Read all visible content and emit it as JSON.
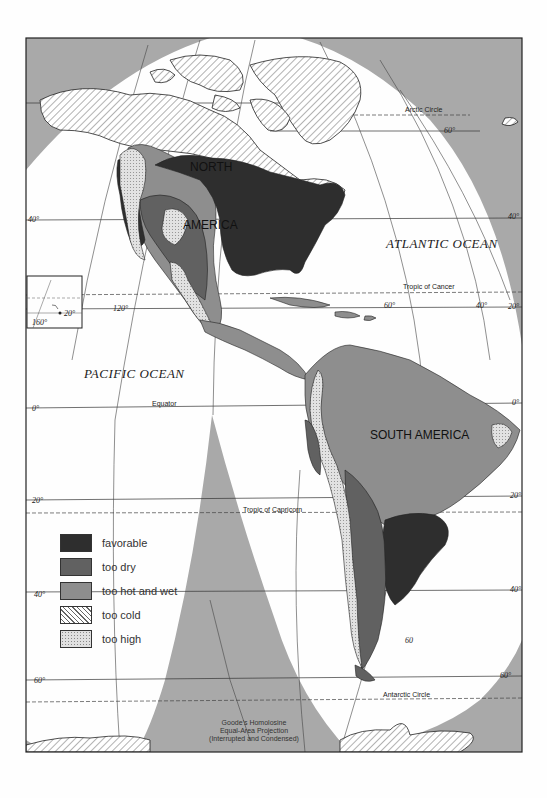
{
  "map": {
    "projection_caption": [
      "Goode's Homolosine",
      "Equal-Area Projection",
      "(Interrupted and Condensed)"
    ],
    "continents": [
      "NORTH",
      "AMERICA",
      "SOUTH AMERICA"
    ],
    "oceans": [
      "ATLANTIC OCEAN",
      "PACIFIC OCEAN"
    ],
    "reference_lines": {
      "arctic_circle": "Arctic Circle",
      "tropic_cancer": "Tropic of Cancer",
      "equator": "Equator",
      "tropic_capricorn": "Tropic of Capricorn",
      "antarctic_circle": "Antarctic Circle"
    },
    "latitude_labels": {
      "lat60n_right": "60°",
      "lat40n_left": "40°",
      "lat40n_right": "40°",
      "lat20n_right": "20°",
      "lat0_left": "0°",
      "lat0_right": "0°",
      "lat20s_left": "20°",
      "lat20s_right": "20°",
      "lat40s_left": "40°",
      "lat40s_right": "40°",
      "lat60s_left": "60°",
      "lat60s_right": "60°"
    },
    "longitude_labels": {
      "lon120": "120°",
      "lon60": "60°",
      "lon40": "40°",
      "lon60_south": "60"
    },
    "inset": {
      "lon": "160°",
      "lat": "20°"
    }
  },
  "legend": {
    "items": [
      {
        "label": "favorable",
        "color": "#2e2e2e"
      },
      {
        "label": "too dry",
        "color": "#616161"
      },
      {
        "label": "too hot and wet",
        "color": "#8e8e8e"
      },
      {
        "label": "too cold",
        "pattern": "diagonal-hatch"
      },
      {
        "label": "too high",
        "pattern": "stipple"
      }
    ]
  },
  "colors": {
    "interrupt_gray": "#a9a9a9",
    "favorable": "#2e2e2e",
    "too_dry": "#616161",
    "too_hot_wet": "#8e8e8e",
    "too_high": "#d9d9d9",
    "paper": "#fefefe"
  }
}
